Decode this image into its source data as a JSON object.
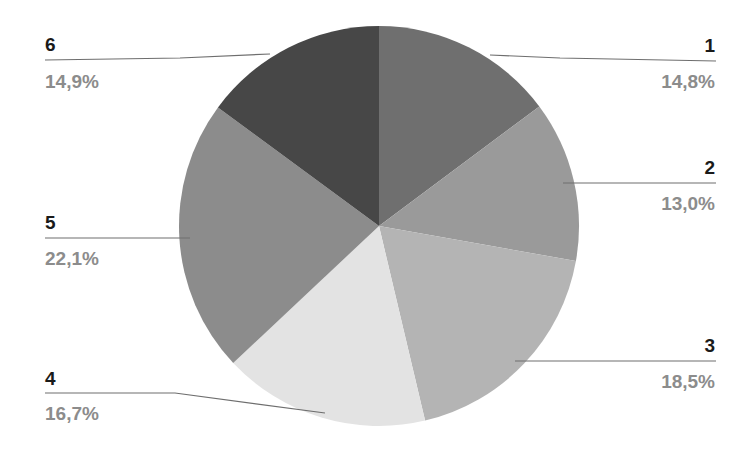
{
  "chart_data": {
    "type": "pie",
    "title": "",
    "categories": [
      "1",
      "2",
      "3",
      "4",
      "5",
      "6"
    ],
    "values": [
      14.8,
      13.0,
      18.5,
      16.7,
      22.1,
      14.9
    ],
    "value_labels": [
      "14,8%",
      "13,0%",
      "18,5%",
      "16,7%",
      "22,1%",
      "14,9%"
    ],
    "colors": [
      "#6f6f6f",
      "#9a9a9a",
      "#b4b4b4",
      "#e3e3e3",
      "#8c8c8c",
      "#474747"
    ],
    "start_angle_deg": 0,
    "direction": "clockwise",
    "legend": "none",
    "labels_position": "outside-with-leader-lines"
  },
  "labels": [
    {
      "name": "1",
      "value": "14,8%"
    },
    {
      "name": "2",
      "value": "13,0%"
    },
    {
      "name": "3",
      "value": "18,5%"
    },
    {
      "name": "4",
      "value": "16,7%"
    },
    {
      "name": "5",
      "value": "22,1%"
    },
    {
      "name": "6",
      "value": "14,9%"
    }
  ]
}
